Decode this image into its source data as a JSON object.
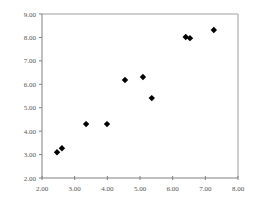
{
  "chart_data": {
    "type": "scatter",
    "title": "",
    "xlabel": "",
    "ylabel": "",
    "xlim": [
      2.0,
      8.0
    ],
    "ylim": [
      2.0,
      9.0
    ],
    "xticks": [
      "2.00",
      "3.00",
      "4.00",
      "5.00",
      "6.00",
      "7.00",
      "8.00"
    ],
    "yticks": [
      "2.00",
      "3.00",
      "4.00",
      "5.00",
      "6.00",
      "7.00",
      "8.00",
      "9.00"
    ],
    "grid": false,
    "legend": null,
    "marker": "diamond",
    "marker_color": "#000000",
    "frame_color": "#a0a0a0",
    "axis_color": "#808080",
    "series": [
      {
        "name": "",
        "points": [
          {
            "x": 2.46,
            "y": 3.1
          },
          {
            "x": 2.61,
            "y": 3.27
          },
          {
            "x": 3.35,
            "y": 4.3
          },
          {
            "x": 3.99,
            "y": 4.3
          },
          {
            "x": 4.54,
            "y": 6.18
          },
          {
            "x": 5.09,
            "y": 6.31
          },
          {
            "x": 5.36,
            "y": 5.41
          },
          {
            "x": 6.4,
            "y": 8.02
          },
          {
            "x": 6.53,
            "y": 7.97
          },
          {
            "x": 7.26,
            "y": 8.32
          }
        ]
      }
    ]
  }
}
